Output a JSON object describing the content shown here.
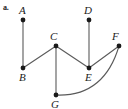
{
  "figure": {
    "part_label": "a.",
    "background_color": "#ffffff",
    "stroke_color": "#5a5a5a",
    "node_color": "#1a1a1a",
    "label_color": "#222222",
    "width": 128,
    "height": 109
  },
  "graph": {
    "type": "undirected-graph",
    "nodes": [
      {
        "id": "A",
        "label": "A",
        "x": 23,
        "y": 20,
        "label_x": 19,
        "label_y": 5,
        "label_pos": "above"
      },
      {
        "id": "B",
        "label": "B",
        "x": 23,
        "y": 68,
        "label_x": 19,
        "label_y": 72,
        "label_pos": "below"
      },
      {
        "id": "C",
        "label": "C",
        "x": 56,
        "y": 46,
        "label_x": 50,
        "label_y": 31,
        "label_pos": "above"
      },
      {
        "id": "D",
        "label": "D",
        "x": 89,
        "y": 20,
        "label_x": 84,
        "label_y": 5,
        "label_pos": "above"
      },
      {
        "id": "E",
        "label": "E",
        "x": 89,
        "y": 68,
        "label_x": 85,
        "label_y": 72,
        "label_pos": "below"
      },
      {
        "id": "F",
        "label": "F",
        "x": 119,
        "y": 46,
        "label_x": 112,
        "label_y": 31,
        "label_pos": "above"
      },
      {
        "id": "G",
        "label": "G",
        "x": 56,
        "y": 95,
        "label_x": 51,
        "label_y": 99,
        "label_pos": "below"
      }
    ],
    "edges": [
      {
        "id": "A-B",
        "from": "A",
        "to": "B",
        "shape": "line"
      },
      {
        "id": "B-C",
        "from": "B",
        "to": "C",
        "shape": "line"
      },
      {
        "id": "C-G",
        "from": "C",
        "to": "G",
        "shape": "line"
      },
      {
        "id": "C-E",
        "from": "C",
        "to": "E",
        "shape": "line"
      },
      {
        "id": "D-E",
        "from": "D",
        "to": "E",
        "shape": "line"
      },
      {
        "id": "E-F",
        "from": "E",
        "to": "F",
        "shape": "line"
      },
      {
        "id": "G-F",
        "from": "G",
        "to": "F",
        "shape": "curve",
        "control_x": 104,
        "control_y": 97
      }
    ]
  }
}
